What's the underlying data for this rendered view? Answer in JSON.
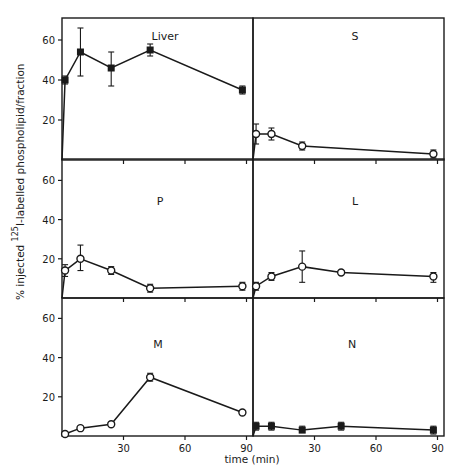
{
  "chart_data": {
    "type": "line",
    "title": "",
    "xlabel": "time (min)",
    "ylabel": "% injected 125I-labelled phospholipid/fraction",
    "ylabel_parts": {
      "prefix": "% injected ",
      "superscript": "125",
      "suffix": "I-labelled phospholipid/fraction"
    },
    "xlim": [
      0,
      95
    ],
    "ylim": [
      0,
      72
    ],
    "x_ticks": [
      30,
      60,
      90
    ],
    "y_ticks": [
      20,
      40,
      60
    ],
    "grid": false,
    "legend": null,
    "layout": {
      "rows": 3,
      "cols": 2
    },
    "panels": [
      {
        "label": "Liver",
        "marker": "filled-square",
        "x": [
          1.5,
          9,
          24,
          43,
          88
        ],
        "values": [
          40,
          54,
          46,
          55,
          35
        ],
        "err_low": [
          38,
          42,
          37,
          52,
          33
        ],
        "err_high": [
          42,
          66,
          54,
          58,
          37
        ]
      },
      {
        "label": "S",
        "marker": "open-circle",
        "x": [
          1.5,
          9,
          24,
          88
        ],
        "values": [
          13,
          13,
          7,
          3
        ],
        "err_low": [
          8,
          10,
          5,
          1
        ],
        "err_high": [
          18,
          16,
          9,
          5
        ]
      },
      {
        "label": "P",
        "marker": "open-circle",
        "x": [
          1.5,
          9,
          24,
          43,
          88
        ],
        "values": [
          14,
          20,
          14,
          5,
          6
        ],
        "err_low": [
          11,
          14,
          12,
          3,
          4
        ],
        "err_high": [
          17,
          27,
          16,
          7,
          8
        ]
      },
      {
        "label": "L",
        "marker": "open-circle",
        "x": [
          1.5,
          9,
          24,
          43,
          88
        ],
        "values": [
          6,
          11,
          16,
          13,
          11
        ],
        "err_low": [
          4,
          9,
          8,
          12,
          8
        ],
        "err_high": [
          8,
          13,
          24,
          14,
          13
        ]
      },
      {
        "label": "M",
        "marker": "open-circle",
        "x": [
          1.5,
          9,
          24,
          43,
          88
        ],
        "values": [
          1,
          4,
          6,
          30,
          12
        ],
        "err_low": [
          0,
          3,
          5,
          28,
          11
        ],
        "err_high": [
          2,
          5,
          7,
          32,
          13
        ]
      },
      {
        "label": "N",
        "marker": "filled-square",
        "x": [
          1.5,
          9,
          24,
          43,
          88
        ],
        "values": [
          5,
          5,
          3,
          5,
          3
        ],
        "err_low": [
          3,
          3,
          2,
          3,
          1
        ],
        "err_high": [
          7,
          7,
          5,
          7,
          5
        ]
      }
    ]
  },
  "colors": {
    "ink": "#1a1a1a",
    "background": "#ffffff"
  }
}
